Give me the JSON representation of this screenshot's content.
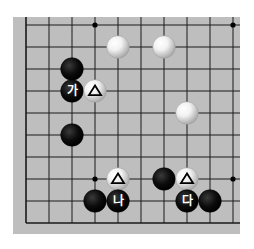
{
  "diagram": {
    "type": "go-board-fragment",
    "board_color": "#bebebe",
    "line_color": "#1a1a1a",
    "grid": {
      "cols": 10,
      "rows": 10,
      "origin_x": 26,
      "origin_y": 25,
      "step_x": 23,
      "step_y": 22,
      "edges": {
        "left": true,
        "bottom": true,
        "top": false,
        "right": false
      }
    },
    "star_points": [
      {
        "col": 3,
        "row": 0
      },
      {
        "col": 9,
        "row": 0
      },
      {
        "col": 3,
        "row": 7
      },
      {
        "col": 9,
        "row": 7
      }
    ],
    "stones": [
      {
        "color": "white",
        "col": 4,
        "row": 1,
        "mark": ""
      },
      {
        "color": "white",
        "col": 6,
        "row": 1,
        "mark": ""
      },
      {
        "color": "black",
        "col": 2,
        "row": 2,
        "mark": ""
      },
      {
        "color": "black",
        "col": 2,
        "row": 3,
        "mark": "가"
      },
      {
        "color": "white",
        "col": 3,
        "row": 3,
        "mark": "triangle"
      },
      {
        "color": "white",
        "col": 7,
        "row": 4,
        "mark": ""
      },
      {
        "color": "black",
        "col": 2,
        "row": 5,
        "mark": ""
      },
      {
        "color": "white",
        "col": 4,
        "row": 7,
        "mark": "triangle"
      },
      {
        "color": "black",
        "col": 6,
        "row": 7,
        "mark": ""
      },
      {
        "color": "white",
        "col": 7,
        "row": 7,
        "mark": "triangle"
      },
      {
        "color": "black",
        "col": 3,
        "row": 8,
        "mark": ""
      },
      {
        "color": "black",
        "col": 4,
        "row": 8,
        "mark": "나"
      },
      {
        "color": "black",
        "col": 7,
        "row": 8,
        "mark": "다"
      },
      {
        "color": "black",
        "col": 8,
        "row": 8,
        "mark": ""
      }
    ],
    "labels": [
      "가",
      "나",
      "다"
    ]
  }
}
